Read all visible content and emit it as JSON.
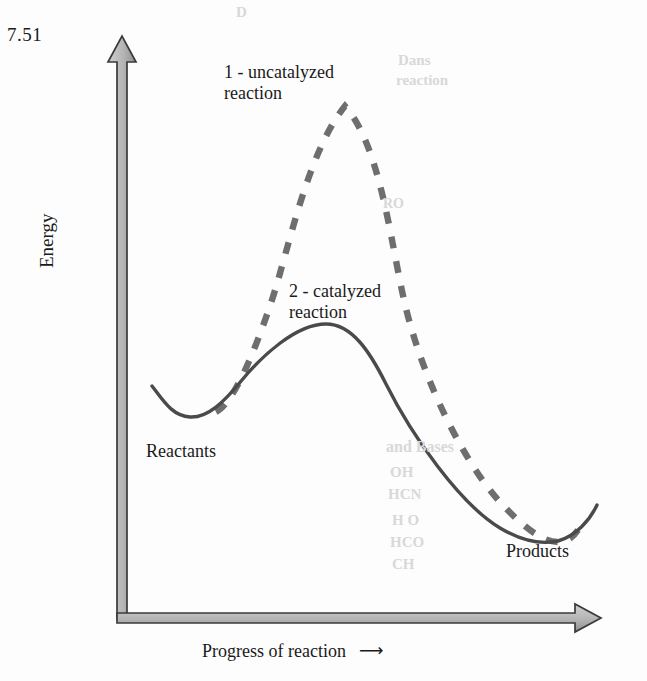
{
  "figure": {
    "problem_number": "7.51",
    "background_color": "#fdfdfd"
  },
  "axes": {
    "y_label": "Energy",
    "x_label": "Progress of reaction",
    "x_label_arrow": "⟶",
    "axis_fill_color": "#bdbdbd",
    "axis_stroke_color": "#3a3a3a"
  },
  "annotations": {
    "uncatalyzed_label": "1 - uncatalyzed\nreaction",
    "catalyzed_label": "2 - catalyzed\nreaction",
    "reactants_label": "Reactants",
    "products_label": "Products"
  },
  "bleed_through": [
    {
      "text": "D",
      "left": 236,
      "top": 4,
      "size": 15
    },
    {
      "text": "Dans",
      "left": 398,
      "top": 52,
      "size": 15
    },
    {
      "text": "reaction",
      "left": 396,
      "top": 72,
      "size": 15
    },
    {
      "text": "RO",
      "left": 383,
      "top": 196,
      "size": 14
    },
    {
      "text": "and Bases",
      "left": 386,
      "top": 438,
      "size": 16
    },
    {
      "text": "OH",
      "left": 390,
      "top": 464,
      "size": 15
    },
    {
      "text": "HCN",
      "left": 388,
      "top": 486,
      "size": 15
    },
    {
      "text": "H O",
      "left": 392,
      "top": 512,
      "size": 15
    },
    {
      "text": "HCO",
      "left": 390,
      "top": 534,
      "size": 15
    },
    {
      "text": "CH",
      "left": 392,
      "top": 556,
      "size": 15
    }
  ],
  "chart_data": {
    "type": "line",
    "title": "",
    "xlabel": "Progress of reaction",
    "ylabel": "Energy",
    "grid": false,
    "legend": "inline-annotations",
    "x_axis_ticks": [],
    "y_axis_ticks": [],
    "series": [
      {
        "name": "1 - uncatalyzed reaction",
        "style": "dashed",
        "color": "#6e6e6e",
        "activation_energy_relative": 1.0,
        "points": [
          {
            "x": 0.16,
            "y": 0.34,
            "role": "reactants"
          },
          {
            "x": 0.28,
            "y": 0.62
          },
          {
            "x": 0.4,
            "y": 0.88
          },
          {
            "x": 0.47,
            "y": 0.95,
            "role": "transition-state"
          },
          {
            "x": 0.56,
            "y": 0.88
          },
          {
            "x": 0.7,
            "y": 0.58
          },
          {
            "x": 0.82,
            "y": 0.24
          },
          {
            "x": 0.91,
            "y": 0.12,
            "role": "products"
          }
        ]
      },
      {
        "name": "2 - catalyzed reaction",
        "style": "solid",
        "color": "#4a4a4a",
        "activation_energy_relative": 0.47,
        "points": [
          {
            "x": 0.07,
            "y": 0.41
          },
          {
            "x": 0.12,
            "y": 0.34,
            "role": "reactants"
          },
          {
            "x": 0.24,
            "y": 0.44
          },
          {
            "x": 0.36,
            "y": 0.56
          },
          {
            "x": 0.43,
            "y": 0.58,
            "role": "transition-state"
          },
          {
            "x": 0.55,
            "y": 0.5
          },
          {
            "x": 0.7,
            "y": 0.3
          },
          {
            "x": 0.82,
            "y": 0.15
          },
          {
            "x": 0.91,
            "y": 0.12,
            "role": "products"
          },
          {
            "x": 0.99,
            "y": 0.19
          }
        ]
      }
    ]
  }
}
